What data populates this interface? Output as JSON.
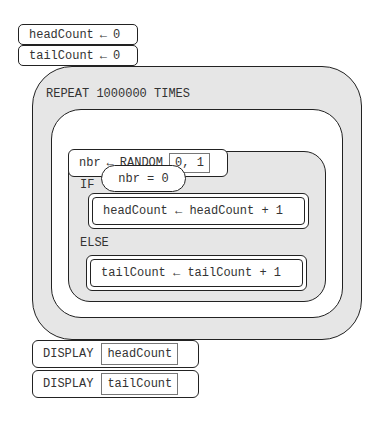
{
  "init": [
    {
      "variable": "headCount",
      "arrow": "←",
      "value": "0"
    },
    {
      "variable": "tailCount",
      "arrow": "←",
      "value": "0"
    }
  ],
  "repeat": {
    "keyword": "REPEAT 1000000 TIMES",
    "assign_random": {
      "variable": "nbr",
      "arrow": "←",
      "keyword": "RANDOM",
      "args": "0, 1"
    },
    "if_block": {
      "keyword_if": "IF",
      "condition": "nbr = 0",
      "then_statement": "headCount ← headCount + 1",
      "keyword_else": "ELSE",
      "else_statement": "tailCount ← tailCount + 1"
    }
  },
  "display": [
    {
      "keyword": "DISPLAY",
      "arg": "headCount"
    },
    {
      "keyword": "DISPLAY",
      "arg": "tailCount"
    }
  ],
  "colors": {
    "block_fill": "#e6e6e6",
    "border": "#222222",
    "text": "#333333"
  }
}
